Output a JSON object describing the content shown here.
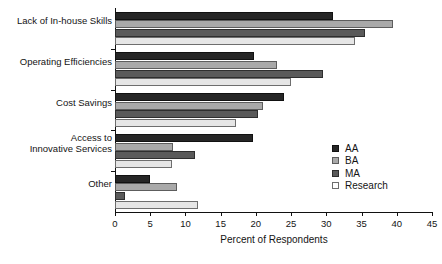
{
  "chart_data": {
    "type": "bar",
    "orientation": "horizontal",
    "title": "",
    "xlabel": "Percent of Respondents",
    "ylabel": "",
    "xlim": [
      0,
      45
    ],
    "xticks": [
      0,
      5,
      10,
      15,
      20,
      25,
      30,
      35,
      40,
      45
    ],
    "grid": false,
    "legend_position": "right-middle",
    "categories": [
      "Lack of In-house Skills",
      "Operating Efficiencies",
      "Cost Savings",
      "Access to\nInnovative Services",
      "Other"
    ],
    "series": [
      {
        "name": "AA",
        "color": "#262626",
        "values": [
          31.0,
          19.8,
          24.0,
          19.6,
          5.0
        ]
      },
      {
        "name": "BA",
        "color": "#a9a9a9",
        "values": [
          39.5,
          23.0,
          21.0,
          8.2,
          8.8
        ]
      },
      {
        "name": "MA",
        "color": "#5a5a5a",
        "values": [
          35.5,
          29.5,
          20.3,
          11.4,
          1.4
        ]
      },
      {
        "name": "Research",
        "color": "#e6e6e6",
        "values": [
          34.0,
          25.0,
          17.2,
          8.1,
          11.8
        ]
      }
    ]
  },
  "legend": {
    "items": [
      {
        "label": "AA"
      },
      {
        "label": "BA"
      },
      {
        "label": "MA"
      },
      {
        "label": "Research"
      }
    ]
  }
}
